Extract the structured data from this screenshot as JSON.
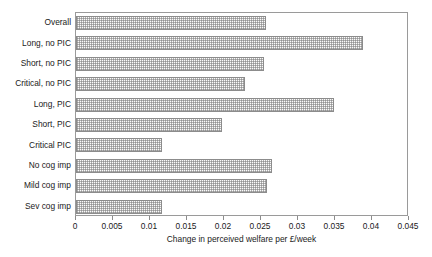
{
  "chart_data": {
    "type": "bar",
    "orientation": "horizontal",
    "title": "",
    "categories": [
      "Overall",
      "Long, no PIC",
      "Short, no PIC",
      "Critical, no PIC",
      "Long, PIC",
      "Short, PIC",
      "Critical PIC",
      "No cog imp",
      "Mild cog imp",
      "Sev cog imp"
    ],
    "values": [
      0.0257,
      0.0388,
      0.0254,
      0.0228,
      0.0349,
      0.0197,
      0.0116,
      0.0265,
      0.0258,
      0.0116
    ],
    "xlabel": "Change in perceived welfare per £/week",
    "ylabel": "",
    "xlim": [
      0,
      0.045
    ],
    "xticks": [
      0,
      0.005,
      0.01,
      0.015,
      0.02,
      0.025,
      0.03,
      0.035,
      0.04,
      0.045
    ],
    "xtick_labels": [
      "0",
      "0.005",
      "0.01",
      "0.015",
      "0.02",
      "0.025",
      "0.03",
      "0.035",
      "0.04",
      "0.045"
    ],
    "grid": false,
    "legend": false,
    "bar_fill": "#fbfbfb",
    "bar_border": "#8c8c8c",
    "frame_color": "#9a9a9a"
  }
}
